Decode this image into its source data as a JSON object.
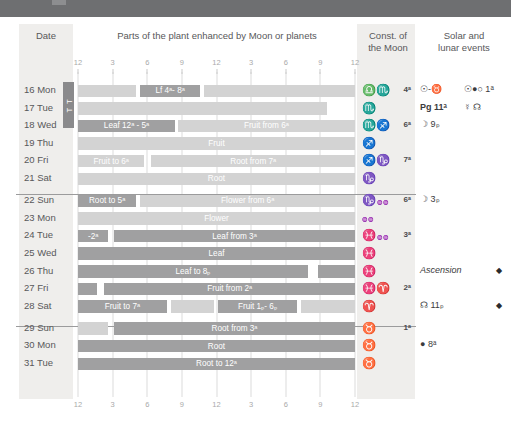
{
  "headers": {
    "date": "Date",
    "parts": "Parts of the plant enhanced by Moon or planets",
    "const": "Const. of\nthe Moon",
    "const_line1": "Const. of",
    "const_line2": "the Moon",
    "events_line1": "Solar and",
    "events_line2": "lunar events"
  },
  "axis": {
    "ticks": [
      "12",
      "3",
      "6",
      "9",
      "12",
      "3",
      "6",
      "9",
      "12"
    ],
    "label": "hours of the day"
  },
  "month_tab": "T T",
  "colors": {
    "top_band": "#6e6f71",
    "panel": "#efeeec",
    "bar_dark": "#a0a0a1",
    "bar_light": "#d3d3d3",
    "text": "#58585a",
    "gridline": "#dcdcdc"
  },
  "rows": [
    {
      "date": "16 Mon",
      "segments": [
        {
          "tone": "light",
          "start": 0,
          "end": 21,
          "label": ""
        },
        {
          "tone": "dark",
          "start": 22.5,
          "end": 44,
          "label": "Lf 4ᵃ- 8ᵃ"
        },
        {
          "tone": "light",
          "start": 45.5,
          "end": 100,
          "label": ""
        }
      ],
      "const_symbol": "♎♏",
      "const_degree": "4ᵃ",
      "event_a": "☉-♉",
      "event_b": "☉●○ 1ᵃ",
      "event_mark": ""
    },
    {
      "date": "17 Tue",
      "segments": [
        {
          "tone": "light",
          "start": 0,
          "end": 90,
          "label": ""
        }
      ],
      "const_symbol": "♏",
      "const_degree": "",
      "event_a": "Pg 11ᵃ",
      "event_b": "☿ ☊",
      "event_mark": "",
      "event_a_bold": true
    },
    {
      "date": "18 Wed",
      "segments": [
        {
          "tone": "dark",
          "start": 0,
          "end": 35,
          "label": "Leaf 12ᵃ - 5ᵃ"
        },
        {
          "tone": "light",
          "start": 36,
          "end": 100,
          "label": "Fruit from 6ᵃ"
        }
      ],
      "const_symbol": "♏♐",
      "const_degree": "6ᵃ",
      "event_a": "☽ 9ₚ",
      "event_b": "",
      "event_mark": ""
    },
    {
      "date": "19 Thu",
      "segments": [
        {
          "tone": "light",
          "start": 0,
          "end": 100,
          "label": "Fruit"
        }
      ],
      "const_symbol": "♐",
      "const_degree": "",
      "event_a": "",
      "event_b": "",
      "event_mark": ""
    },
    {
      "date": "20 Fri",
      "segments": [
        {
          "tone": "light",
          "start": 0,
          "end": 24,
          "label": "Fruit to 6ᵃ"
        },
        {
          "tone": "light",
          "start": 26.5,
          "end": 100,
          "label": "Root from 7ᵃ"
        }
      ],
      "const_symbol": "♐♑",
      "const_degree": "7ᵃ",
      "event_a": "",
      "event_b": "",
      "event_mark": ""
    },
    {
      "date": "21 Sat",
      "segments": [
        {
          "tone": "light",
          "start": 0,
          "end": 100,
          "label": "Root"
        }
      ],
      "const_symbol": "♑",
      "const_degree": "",
      "event_a": "",
      "event_b": "",
      "event_mark": ""
    },
    {
      "date": "22 Sun",
      "segments": [
        {
          "tone": "dark",
          "start": 0,
          "end": 21,
          "label": "Root to 5ᵃ"
        },
        {
          "tone": "light",
          "start": 22.5,
          "end": 100,
          "label": "Flower from 6ᵃ"
        }
      ],
      "const_symbol": "♑",
      "const_tiny": "♒",
      "const_degree": "6ᵃ",
      "event_a": "☽ 3ₚ",
      "event_b": "",
      "event_mark": ""
    },
    {
      "date": "23 Mon",
      "segments": [
        {
          "tone": "light",
          "start": 0,
          "end": 100,
          "label": "Flower"
        }
      ],
      "const_symbol": "",
      "const_tiny": "♒",
      "const_degree": "",
      "event_a": "",
      "event_b": "",
      "event_mark": ""
    },
    {
      "date": "24 Tue",
      "segments": [
        {
          "tone": "dark",
          "start": 0,
          "end": 11,
          "label": "-2ᵃ"
        },
        {
          "tone": "dark",
          "start": 13,
          "end": 100,
          "label": "Leaf from 3ᵃ"
        }
      ],
      "const_symbol": "♓",
      "const_tiny": "♒",
      "const_degree": "3ᵃ",
      "event_a": "",
      "event_b": "",
      "event_mark": ""
    },
    {
      "date": "25 Wed",
      "segments": [
        {
          "tone": "dark",
          "start": 0,
          "end": 100,
          "label": "Leaf"
        }
      ],
      "const_symbol": "♓",
      "const_degree": "",
      "event_a": "",
      "event_b": "",
      "event_mark": ""
    },
    {
      "date": "26 Thu",
      "segments": [
        {
          "tone": "dark",
          "start": 0,
          "end": 83,
          "label": "Leaf to 8ₚ"
        },
        {
          "tone": "dark",
          "start": 86.5,
          "end": 100,
          "label": ""
        }
      ],
      "const_symbol": "♓",
      "const_degree": "",
      "event_a": "Ascension",
      "event_a_italic": true,
      "event_b": "",
      "event_mark": "◆"
    },
    {
      "date": "27 Fri",
      "segments": [
        {
          "tone": "dark",
          "start": 0,
          "end": 7,
          "label": ""
        },
        {
          "tone": "dark",
          "start": 9.5,
          "end": 100,
          "label": "Fruit from 2ᵃ"
        }
      ],
      "const_symbol": "♓♈",
      "const_degree": "2ᵃ",
      "event_a": "",
      "event_b": "",
      "event_mark": ""
    },
    {
      "date": "28 Sat",
      "segments": [
        {
          "tone": "dark",
          "start": 0,
          "end": 32,
          "label": "Fruit to 7ᵃ"
        },
        {
          "tone": "light",
          "start": 33.5,
          "end": 49,
          "label": ""
        },
        {
          "tone": "dark",
          "start": 50.5,
          "end": 79,
          "label": "Fruit 1ₚ- 6ₚ"
        },
        {
          "tone": "light",
          "start": 80.5,
          "end": 100,
          "label": ""
        }
      ],
      "const_symbol": "♈",
      "const_degree": "",
      "event_a": "☊ 11ₚ",
      "event_b": "",
      "event_mark": "◆"
    },
    {
      "date": "29 Sun",
      "segments": [
        {
          "tone": "light",
          "start": 0,
          "end": 11,
          "label": ""
        },
        {
          "tone": "dark",
          "start": 13,
          "end": 100,
          "label": "Root from 3ᵃ"
        }
      ],
      "const_symbol": "♉",
      "const_degree": "1ᵃ",
      "event_a": "",
      "event_b": "",
      "event_mark": ""
    },
    {
      "date": "30 Mon",
      "segments": [
        {
          "tone": "dark",
          "start": 0,
          "end": 100,
          "label": "Root"
        }
      ],
      "const_symbol": "♉",
      "const_degree": "",
      "event_a": "● 8ᵃ",
      "event_b": "",
      "event_mark": ""
    },
    {
      "date": "31 Tue",
      "segments": [
        {
          "tone": "dark",
          "start": 0,
          "end": 100,
          "label": "Root to 12ᵃ"
        }
      ],
      "const_symbol": "♉",
      "const_degree": "",
      "event_a": "",
      "event_b": "",
      "event_mark": ""
    }
  ],
  "block_breaks_after": [
    5,
    12
  ]
}
